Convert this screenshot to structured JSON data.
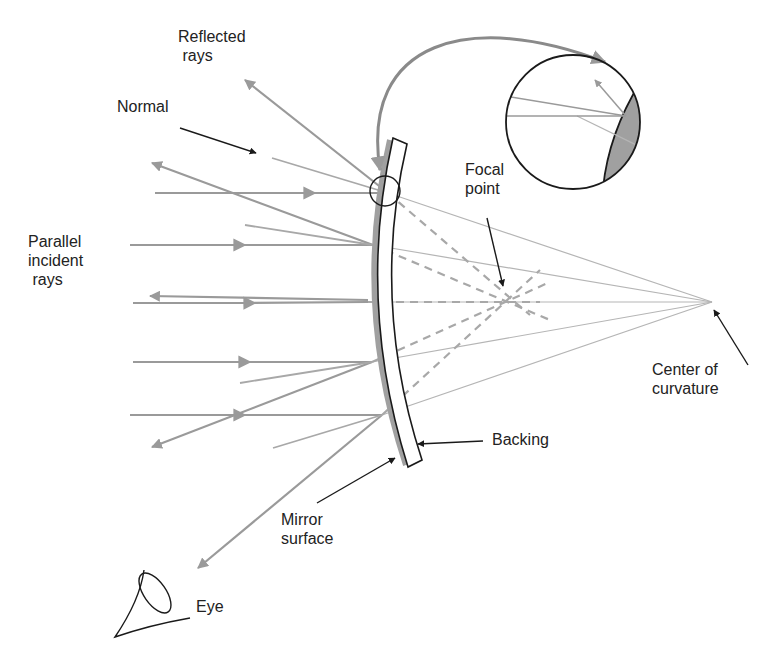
{
  "diagram": {
    "colors": {
      "ray": "#9a9a9a",
      "normal_line": "#b5b5b5",
      "dashed_extension": "#a8a8a8",
      "mirror_surface": "#a0a0a0",
      "outline": "#1a1a1a",
      "label_text": "#222222",
      "background": "#ffffff"
    },
    "labels": {
      "reflected_rays": "Reflected\n rays",
      "normal": "Normal",
      "focal_point": "Focal\npoint",
      "parallel_incident_rays": "Parallel\nincident\n rays",
      "center_of_curvature": "Center of\ncurvature",
      "backing": "Backing",
      "mirror_surface": "Mirror\nsurface",
      "eye": "Eye"
    },
    "icons": {
      "eye": "eye-icon",
      "magnifier_inset": "magnified-detail-inset"
    }
  }
}
